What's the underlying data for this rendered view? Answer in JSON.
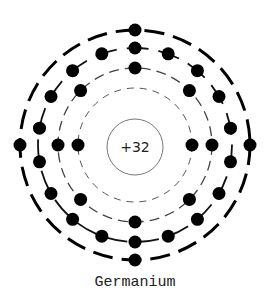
{
  "title": "Germanium",
  "element": {
    "name": "Germanium",
    "nucleus_charge": "+32",
    "atomic_number": 32,
    "electron_configuration": [
      2,
      8,
      18,
      4
    ]
  },
  "layout": {
    "center": [
      135,
      145
    ],
    "nucleus_radius": 28,
    "electron_radius": 6.5,
    "shells": [
      {
        "index": 1,
        "radius": 57,
        "electrons": 2,
        "start_angle": 0,
        "stroke_width": 1,
        "dash": "7 6",
        "color": "#555555"
      },
      {
        "index": 2,
        "radius": 77,
        "electrons": 8,
        "start_angle": 0,
        "stroke_width": 1.3,
        "dash": "10 6",
        "color": "#444444"
      },
      {
        "index": 3,
        "radius": 97,
        "electrons": 18,
        "start_angle": 90,
        "stroke_width": 1.8,
        "dash": "22 10",
        "color": "#111111"
      },
      {
        "index": 4,
        "radius": 115,
        "electrons": 4,
        "start_angle": 0,
        "stroke_width": 3,
        "dash": "20 9",
        "color": "#000000"
      }
    ]
  },
  "colors": {
    "electron": "#000000",
    "nucleus_stroke": "#777777",
    "background": "#ffffff"
  }
}
